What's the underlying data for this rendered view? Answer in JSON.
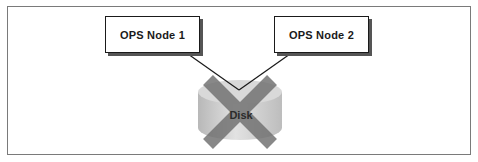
{
  "diagram": {
    "nodes": [
      {
        "id": "node1",
        "label": "OPS Node 1"
      },
      {
        "id": "node2",
        "label": "OPS Node 2"
      }
    ],
    "disk": {
      "label": "Disk",
      "status": "failed (crossed out)"
    },
    "connections": [
      {
        "from": "OPS Node 1",
        "to": "Disk"
      },
      {
        "from": "OPS Node 2",
        "to": "Disk"
      }
    ],
    "colors": {
      "frame": "#7a7a7a",
      "node_border": "#1a1a1a",
      "node_shadow": "#555555",
      "disk_body": "#c8c8c8",
      "disk_top": "#dedede",
      "cross": "#6f6f6f"
    }
  }
}
